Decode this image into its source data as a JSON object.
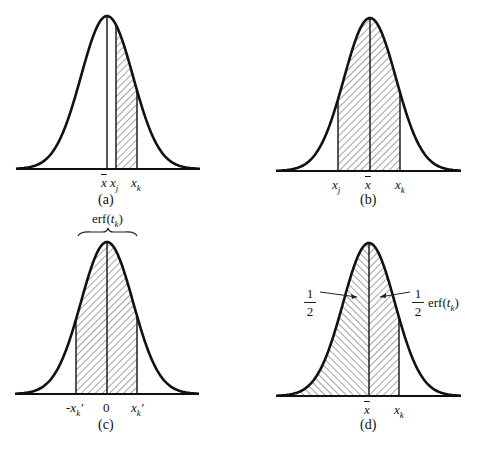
{
  "panels": [
    {
      "id": "a",
      "caption": "(a)",
      "labels": [
        "x̄",
        "x_j",
        "x_k"
      ],
      "shaded": "between x_j and x_k (right of mean)"
    },
    {
      "id": "b",
      "caption": "(b)",
      "labels": [
        "x_j",
        "x̄",
        "x_k"
      ],
      "shaded": "between x_j and x_k (spanning mean)"
    },
    {
      "id": "c",
      "caption": "(c)",
      "labels": [
        "-x'_k",
        "0",
        "x'_k"
      ],
      "shaded": "between -x'_k and x'_k",
      "brace_label": "erf(t_k)"
    },
    {
      "id": "d",
      "caption": "(d)",
      "labels": [
        "x̄",
        "x_k"
      ],
      "shaded": "from -∞ to x_k",
      "annotations": [
        "1/2",
        "1/2 erf(t_k)"
      ]
    }
  ],
  "text": {
    "xbar": "x",
    "x": "x",
    "j": "j",
    "k": "k",
    "zero": "0",
    "neg": "-",
    "prime": "′",
    "erf": "erf(",
    "t": "t",
    "close": ")",
    "one": "1",
    "two": "2",
    "cap_a": "(a)",
    "cap_b": "(b)",
    "cap_c": "(c)",
    "cap_d": "(d)"
  }
}
